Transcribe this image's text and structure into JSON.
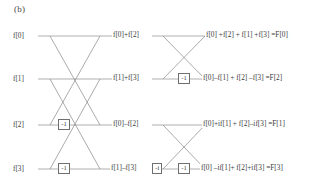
{
  "figure": {
    "panel_label": "(b)",
    "type": "fft-butterfly-diagram",
    "stroke_color": "#8c8c8c",
    "text_color": "#3c3c3c"
  },
  "inputs": [
    {
      "label": "f[0]"
    },
    {
      "label": "f[1]"
    },
    {
      "label": "f[2]"
    },
    {
      "label": "f[3]"
    }
  ],
  "stage1_twiddles": [
    {
      "label": "-1",
      "row": 3
    },
    {
      "label": "-1",
      "row": 4
    }
  ],
  "stage1_outputs": [
    {
      "label": "f[0]+f[2]"
    },
    {
      "label": "f[1]+f[3]"
    },
    {
      "label": "f[0]–f[2]"
    },
    {
      "label": "f[1]–f[3]"
    }
  ],
  "stage2_twiddles": [
    {
      "label": "-1",
      "row": 2
    },
    {
      "label": "-i",
      "row": 4
    },
    {
      "label": "-1",
      "row": 4
    }
  ],
  "outputs": [
    {
      "label": "f[0] +f[2] + f[1] +f[3] =F[0]"
    },
    {
      "label": "f[0]–f[1] + f[2] –f[3] =F[2]"
    },
    {
      "label": "f[0]+if[1] + f[2]–if[3] =F[1]"
    },
    {
      "label": "f[0] –if[1]+ f[2]+if[3] =F[3]"
    }
  ]
}
